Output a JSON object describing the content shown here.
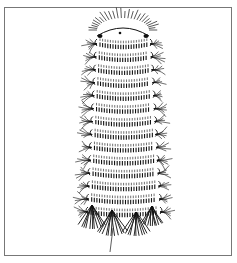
{
  "figure": {
    "style": "black ink line art on white",
    "frame_color": "#777777",
    "ink_color": "#111111",
    "background": "#ffffff",
    "body": {
      "segments": 14,
      "top_y": 28,
      "bottom_y": 210,
      "top_left_x": 97,
      "top_right_x": 150,
      "bottom_left_x": 88,
      "bottom_right_x": 160
    },
    "head": {
      "cx": 123,
      "cy": 30,
      "rx": 26,
      "ry": 12,
      "bristle_count": 26
    },
    "tail_line": {
      "x1": 113,
      "y1": 228,
      "x2": 110,
      "y2": 252
    }
  }
}
